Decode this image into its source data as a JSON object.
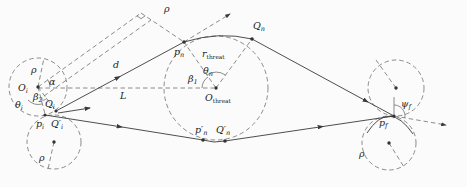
{
  "figure": {
    "background": "#fbfbfb",
    "construction_color": "#6e6e6e",
    "path_color": "#3a3a3a",
    "text_color": "#222222",
    "labels": {
      "rho_offset": {
        "m": "ρ"
      },
      "q_n": {
        "m": "Q",
        "s": "n"
      },
      "p_n": {
        "m": "p",
        "s": "n"
      },
      "r_threat": {
        "m": "r",
        "s": "threat"
      },
      "d": {
        "m": "d"
      },
      "rho_init_upper": {
        "m": "ρ"
      },
      "o_i": {
        "m": "O",
        "s": "i"
      },
      "alpha": {
        "m": "α"
      },
      "beta_2": {
        "m": "β",
        "s": "2"
      },
      "theta_i": {
        "m": "θ",
        "s": "i"
      },
      "q_i": {
        "m": "Q",
        "s": "i"
      },
      "beta_1": {
        "m": "β",
        "s": "1"
      },
      "theta_n": {
        "m": "θ",
        "s": "n"
      },
      "o_threat": {
        "m": "O",
        "s": "threat"
      },
      "L": {
        "m": "L"
      },
      "p_i": {
        "m": "p",
        "s": "i"
      },
      "q_i_prime": {
        "m": "Q′",
        "s": "i"
      },
      "rho_init_lower": {
        "m": "ρ"
      },
      "p_n_prime": {
        "m": "p′",
        "s": "n"
      },
      "q_n_prime": {
        "m": "Q′",
        "s": "n"
      },
      "psi_f": {
        "m": "ψ",
        "s": "f"
      },
      "p_f": {
        "m": "p",
        "s": "f"
      },
      "rho_final_lower": {
        "m": "ρ"
      }
    }
  }
}
